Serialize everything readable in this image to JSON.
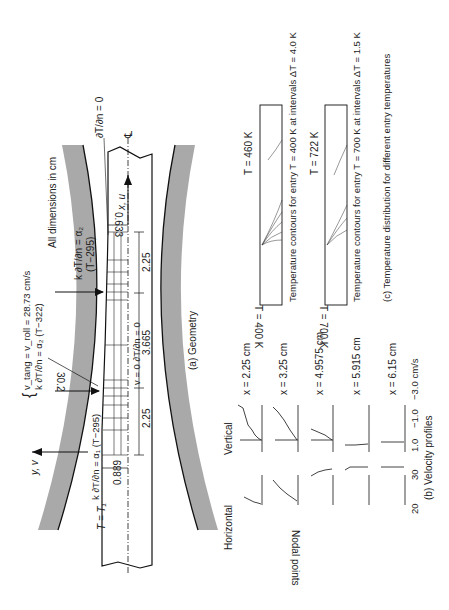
{
  "figure": {
    "orientation": "rotated-90-ccw",
    "panel_a": {
      "caption": "(a) Geometry",
      "note": "All dimensions in cm",
      "centerline_symbol": "℄",
      "x_axis_label": "x, u",
      "y_axis_label": "y, v",
      "bc_exit": "∂T/∂n = 0",
      "bc_roll_exit": "k ∂T/∂n = α₂",
      "bc_roll_exit_sub": "(T−295)",
      "bc_neutral_line1": "v_tang = v_roll = 28.73 cm/s",
      "bc_neutral_line2": "k ∂T/∂n = α₂ (T−322)",
      "bc_center": "v = 0  ∂T/∂n = 0",
      "bc_entry_roll": "k ∂T/∂n = α₁ (T−295)",
      "bc_entry": "T = T₁",
      "angle": "30.2",
      "dims": {
        "exit_half_thickness": "0.633",
        "entry_half_thickness": "0.889",
        "seg1": "2.25",
        "seg2": "3.665",
        "seg3": "2.25"
      }
    },
    "panel_b": {
      "caption": "(b) Velocity profiles",
      "yaxis_label": "Nodal points",
      "col_horizontal": "Horizontal",
      "col_vertical": "Vertical",
      "horizontal_ticks": [
        "20",
        "30"
      ],
      "vertical_ticks": [
        "1.0",
        "−1.0",
        "−3.0 cm/s"
      ],
      "node_top": "9",
      "node_bottom": "1",
      "rows": [
        {
          "label": "x = 2.25 cm"
        },
        {
          "label": "x = 3.25 cm"
        },
        {
          "label": "x = 4.9575 cm"
        },
        {
          "label": "x = 5.915 cm"
        },
        {
          "label": "x = 6.15 cm"
        }
      ]
    },
    "panel_c": {
      "caption": "(c) Temperature distribution for different entry temperatures",
      "plots": [
        {
          "entry_label": "T = 400 K",
          "peak_label": "T = 460 K",
          "caption": "Temperature contours for entry T = 400 K at intervals ΔT = 4.0 K"
        },
        {
          "entry_label": "T = 700 K",
          "peak_label": "T = 722 K",
          "caption": "Temperature contours for entry T = 700 K at intervals ΔT = 1.5 K"
        }
      ]
    }
  }
}
